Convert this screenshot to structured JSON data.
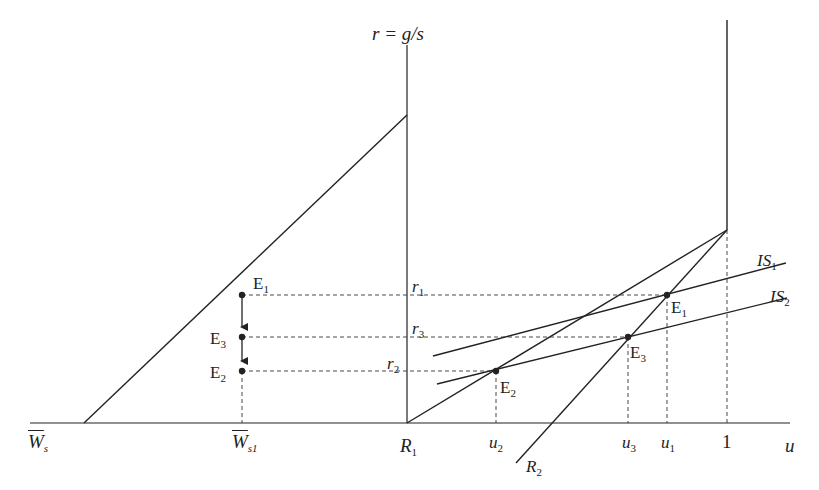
{
  "diagram": {
    "type": "economic-model-diagram",
    "title_cropped": "(title partially cut off at top edge)",
    "axes": {
      "vertical_label": "r = g/s",
      "horizontal_label": "u",
      "origin_label": "R",
      "origin_sub": "1"
    },
    "x_axis_ticks_left": [
      {
        "main": "W",
        "sub": "s",
        "bar": true
      },
      {
        "main": "W",
        "sub": "s1",
        "bar": true
      }
    ],
    "x_axis_ticks_right": [
      {
        "main": "u",
        "sub": "2"
      },
      {
        "main": "u",
        "sub": "3"
      },
      {
        "main": "u",
        "sub": "1"
      },
      {
        "main": "1",
        "sub": ""
      }
    ],
    "curves": {
      "is1": {
        "main": "IS",
        "sub": "1"
      },
      "is2": {
        "main": "IS",
        "sub": "2"
      },
      "r2": {
        "main": "R",
        "sub": "2"
      }
    },
    "rate_labels": [
      {
        "main": "r",
        "sub": "1"
      },
      {
        "main": "r",
        "sub": "3"
      },
      {
        "main": "r",
        "sub": "2"
      }
    ],
    "equilibria_right": [
      {
        "main": "E",
        "sub": "1"
      },
      {
        "main": "E",
        "sub": "3"
      },
      {
        "main": "E",
        "sub": "2"
      }
    ],
    "equilibria_left": [
      {
        "main": "E",
        "sub": "1"
      },
      {
        "main": "E",
        "sub": "3"
      },
      {
        "main": "E",
        "sub": "2"
      }
    ],
    "colors": {
      "line": "#222222",
      "background": "#ffffff"
    }
  }
}
